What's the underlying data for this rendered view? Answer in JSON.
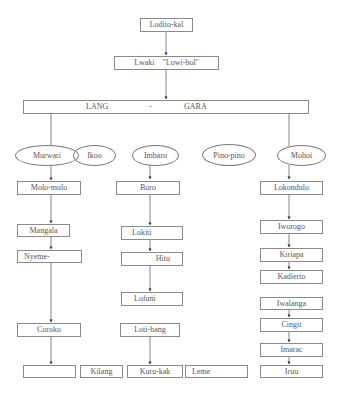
{
  "diagram": {
    "root": "Lodito-kal",
    "level2": "Lwaki    \"Lowi-bol\"",
    "level3": {
      "left": "LANG",
      "sep": "-",
      "right": "GARA"
    },
    "clans": [
      "Murwari",
      "Ikoo",
      "Imbaro",
      "Pino-pino",
      "Mohoi"
    ],
    "murwari_chain": [
      "Molo-molo",
      "Mangala",
      "Nyeme-",
      "Coroko",
      ""
    ],
    "imbaro_chain": [
      "Boro",
      "Lokiti",
      "Hitu",
      "Lofuni",
      "Loti-bang",
      "Kuru-kak"
    ],
    "mohoi_chain": [
      "Lokondulo",
      "Iworogo",
      "Kiriapa",
      "Kadierto",
      "Iwalanga",
      "Cingit",
      "Imarac",
      "Iruu"
    ],
    "bottom_extra": [
      "Kilang",
      "Leme"
    ]
  }
}
